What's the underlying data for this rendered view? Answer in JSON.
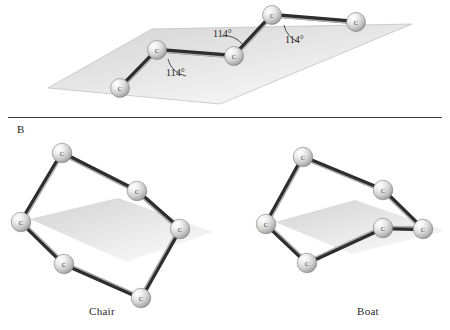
{
  "figure": {
    "background_color": "#ffffff",
    "divider_color": "#3d3d3d"
  },
  "panel_top": {
    "name": "zigzag-carbon-chain",
    "description": "Zigzag carbon chain lying on a tilted plane with bond angles marked",
    "plane_color": "#d9d9d9",
    "atom_label": "C",
    "atoms": [
      {
        "id": "c1",
        "label": "C",
        "x": 120,
        "y": 88
      },
      {
        "id": "c2",
        "label": "C",
        "x": 157,
        "y": 50
      },
      {
        "id": "c3",
        "label": "C",
        "x": 234,
        "y": 56
      },
      {
        "id": "c4",
        "label": "C",
        "x": 272,
        "y": 15
      },
      {
        "id": "c5",
        "label": "C",
        "x": 356,
        "y": 22
      }
    ],
    "bonds": [
      {
        "from": "c1",
        "to": "c2"
      },
      {
        "from": "c2",
        "to": "c3"
      },
      {
        "from": "c3",
        "to": "c4"
      },
      {
        "from": "c4",
        "to": "c5"
      }
    ],
    "angle_labels": [
      {
        "text": "114°",
        "x": 166,
        "y": 76
      },
      {
        "text": "114°",
        "x": 213,
        "y": 37
      },
      {
        "text": "114°",
        "x": 285,
        "y": 43
      }
    ]
  },
  "panel_b": {
    "letter": "B",
    "letter_x": 17,
    "letter_y": 123
  },
  "chair": {
    "name": "chair-conformation",
    "caption": "Chair",
    "caption_x": 89,
    "caption_y": 305,
    "plane_color": "#dadada",
    "atom_label": "C",
    "atoms": [
      {
        "id": "a1",
        "label": "C",
        "x": 62,
        "y": 153
      },
      {
        "id": "a2",
        "label": "C",
        "x": 137,
        "y": 191
      },
      {
        "id": "a3",
        "label": "C",
        "x": 180,
        "y": 229
      },
      {
        "id": "a4",
        "label": "C",
        "x": 141,
        "y": 298
      },
      {
        "id": "a5",
        "label": "C",
        "x": 64,
        "y": 264
      },
      {
        "id": "a6",
        "label": "C",
        "x": 21,
        "y": 222
      }
    ],
    "bonds": [
      {
        "from": "a1",
        "to": "a2"
      },
      {
        "from": "a2",
        "to": "a3"
      },
      {
        "from": "a3",
        "to": "a4"
      },
      {
        "from": "a4",
        "to": "a5"
      },
      {
        "from": "a5",
        "to": "a6"
      },
      {
        "from": "a6",
        "to": "a1"
      }
    ]
  },
  "boat": {
    "name": "boat-conformation",
    "caption": "Boat",
    "caption_x": 357,
    "caption_y": 305,
    "plane_color": "#dadada",
    "atom_label": "C",
    "atoms": [
      {
        "id": "b1",
        "label": "C",
        "x": 303,
        "y": 157
      },
      {
        "id": "b2",
        "label": "C",
        "x": 383,
        "y": 190
      },
      {
        "id": "b3",
        "label": "C",
        "x": 423,
        "y": 229
      },
      {
        "id": "b4",
        "label": "C",
        "x": 383,
        "y": 228
      },
      {
        "id": "b5",
        "label": "C",
        "x": 307,
        "y": 263
      },
      {
        "id": "b6",
        "label": "C",
        "x": 266,
        "y": 224
      }
    ],
    "bonds": [
      {
        "from": "b1",
        "to": "b2"
      },
      {
        "from": "b2",
        "to": "b3"
      },
      {
        "from": "b3",
        "to": "b4"
      },
      {
        "from": "b4",
        "to": "b5"
      },
      {
        "from": "b5",
        "to": "b6"
      },
      {
        "from": "b6",
        "to": "b1"
      }
    ]
  },
  "colors": {
    "bond_dark": "#2e2e2e",
    "bond_light": "#b9b9b9",
    "sphere_highlight": "#ffffff",
    "sphere_mid": "#c6c6c6",
    "sphere_edge": "#6e6e6e",
    "text": "#1f1f1f"
  }
}
